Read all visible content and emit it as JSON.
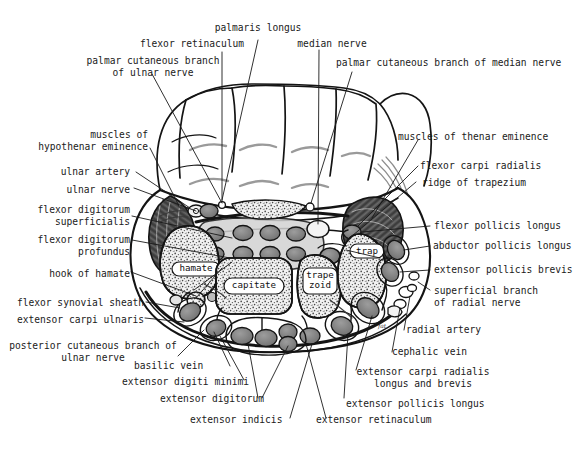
{
  "figure": {
    "ink_color": "#1a1a1a",
    "paper_color": "#ffffff",
    "muscle_fill": "#6f6f6f",
    "bone_fill": "#e8e8e8",
    "tendon_fill": "#8c8c8c",
    "sheath_fill": "#9a9a9a"
  },
  "labels": {
    "top": [
      {
        "id": "palmaris-longus",
        "text": "palmaris longus"
      },
      {
        "id": "flexor-retinaculum",
        "text": "flexor retinaculum"
      },
      {
        "id": "median-nerve",
        "text": "median nerve"
      },
      {
        "id": "palmar-cutaneous-branch-ulnar-nerve",
        "text": "palmar cutaneous branch\nof ulnar nerve"
      },
      {
        "id": "palmar-cutaneous-branch-median-nerve",
        "text": "palmar cutaneous branch of median nerve"
      }
    ],
    "left": [
      {
        "id": "muscles-of-hypothenar-eminence",
        "text": "muscles of\nhypothenar eminence"
      },
      {
        "id": "ulnar-artery",
        "text": "ulnar artery"
      },
      {
        "id": "ulnar-nerve",
        "text": "ulnar nerve"
      },
      {
        "id": "flexor-digitorum-superficialis",
        "text": "flexor digitorum\nsuperficialis"
      },
      {
        "id": "flexor-digitorum-profundus",
        "text": "flexor digitorum\nprofundus"
      },
      {
        "id": "hook-of-hamate",
        "text": "hook of hamate"
      },
      {
        "id": "flexor-synovial-sheath",
        "text": "flexor synovial sheath"
      },
      {
        "id": "extensor-carpi-ulnaris",
        "text": "extensor carpi ulnaris"
      },
      {
        "id": "posterior-cutaneous-branch-ulnar-nerve",
        "text": "posterior cutaneous branch of\nulnar nerve"
      }
    ],
    "right": [
      {
        "id": "muscles-of-thenar-eminence",
        "text": "muscles of thenar eminence"
      },
      {
        "id": "flexor-carpi-radialis",
        "text": "flexor carpi radialis"
      },
      {
        "id": "ridge-of-trapezium",
        "text": "ridge of trapezium"
      },
      {
        "id": "flexor-pollicis-longus",
        "text": "flexor pollicis longus"
      },
      {
        "id": "abductor-pollicis-longus",
        "text": "abductor pollicis longus"
      },
      {
        "id": "extensor-pollicis-brevis",
        "text": "extensor pollicis brevis"
      },
      {
        "id": "superficial-branch-radial-nerve",
        "text": "superficial branch\nof radial nerve"
      },
      {
        "id": "radial-artery",
        "text": "radial artery"
      },
      {
        "id": "cephalic-vein",
        "text": "cephalic vein"
      },
      {
        "id": "extensor-carpi-radialis-longus-brevis",
        "text": "extensor carpi radialis\nlongus and brevis"
      },
      {
        "id": "extensor-pollicis-longus",
        "text": "extensor pollicis longus"
      }
    ],
    "bottom": [
      {
        "id": "basilic-vein",
        "text": "basilic vein"
      },
      {
        "id": "extensor-digiti-minimi",
        "text": "extensor digiti minimi"
      },
      {
        "id": "extensor-digitorum",
        "text": "extensor digitorum"
      },
      {
        "id": "extensor-indicis",
        "text": "extensor indicis"
      },
      {
        "id": "extensor-retinaculum",
        "text": "extensor retinaculum"
      }
    ],
    "inline": [
      {
        "id": "bone-hamate",
        "text": "hamate"
      },
      {
        "id": "bone-capitate",
        "text": "capitate"
      },
      {
        "id": "bone-trapezoid",
        "text": "trape\nzoid"
      },
      {
        "id": "bone-trapezium",
        "text": "trap"
      },
      {
        "id": "fat-pad",
        "text": "fat"
      }
    ]
  }
}
